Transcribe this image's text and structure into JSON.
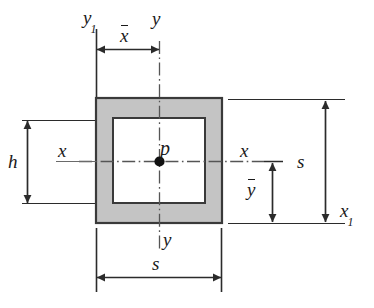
{
  "figure": {
    "colors": {
      "fill_gray": "#c4c4c4",
      "outline": "#3a3a3a",
      "line": "#2b2b2b",
      "background": "#ffffff",
      "text": "#1a1a1a"
    }
  },
  "shape": {
    "outer_square": {
      "x": 96,
      "y": 98,
      "width": 126,
      "height": 125,
      "label": "s"
    },
    "inner_square": {
      "x": 113,
      "y": 118,
      "width": 92,
      "height": 85,
      "label": "h"
    },
    "centroid": {
      "x": 159,
      "y": 161,
      "label": "p"
    }
  },
  "labels": {
    "y1": "y",
    "y1_sub": "1",
    "x_bar": "x",
    "y_top": "y",
    "y_bottom": "y",
    "x_left": "x",
    "x_right": "x",
    "x1": "x",
    "x1_sub": "1",
    "h": "h",
    "s_right": "s",
    "s_bottom": "s",
    "y_bar": "y",
    "centroid": "p"
  },
  "dimensions": [
    {
      "name": "x-bar",
      "label": "x",
      "overbar": true,
      "orientation": "horizontal",
      "from": 96,
      "to": 159,
      "at": 49
    },
    {
      "name": "h",
      "label": "h",
      "overbar": false,
      "orientation": "vertical",
      "from": 120,
      "to": 203,
      "at": 27
    },
    {
      "name": "s-right",
      "label": "s",
      "overbar": false,
      "orientation": "vertical",
      "from": 100,
      "to": 223,
      "at": 325
    },
    {
      "name": "y-bar",
      "label": "y",
      "overbar": true,
      "orientation": "vertical",
      "from": 161,
      "to": 223,
      "at": 272
    },
    {
      "name": "s-bottom",
      "label": "s",
      "overbar": false,
      "orientation": "horizontal",
      "from": 96,
      "to": 222,
      "at": 277
    }
  ],
  "axes": [
    {
      "name": "y-centroidal-axis",
      "type": "dash-dot",
      "orientation": "vertical",
      "x": 159,
      "from": 40,
      "to": 252
    },
    {
      "name": "x-centroidal-axis",
      "type": "dash-dot",
      "orientation": "horizontal",
      "y": 161,
      "from": 78,
      "to": 264
    },
    {
      "name": "y1-reference-axis",
      "type": "solid",
      "orientation": "vertical",
      "x": 96,
      "from": 28,
      "to": 98
    },
    {
      "name": "x1-reference-axis",
      "type": "solid",
      "orientation": "horizontal",
      "y": 223,
      "from": 228,
      "to": 345
    }
  ]
}
